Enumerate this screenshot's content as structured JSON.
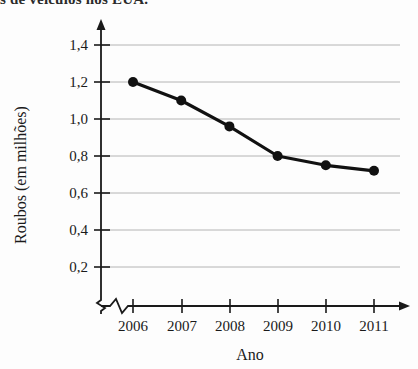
{
  "caption_fragment": "s de veículos nos EUA.",
  "chart_data": {
    "type": "line",
    "title": "",
    "xlabel": "Ano",
    "ylabel": "Roubos (em milhões)",
    "categories": [
      "2006",
      "2007",
      "2008",
      "2009",
      "2010",
      "2011"
    ],
    "values": [
      1.2,
      1.1,
      0.96,
      0.8,
      0.75,
      0.72
    ],
    "value_labels": [
      "1,20",
      "1,10",
      "0,96",
      "0,80",
      "0,75",
      "0,72"
    ],
    "ytick_labels": [
      "0,2",
      "0,4",
      "0,6",
      "0,8",
      "1,0",
      "1,2",
      "1,4"
    ],
    "ytick_values": [
      0.2,
      0.4,
      0.6,
      0.8,
      1.0,
      1.2,
      1.4
    ],
    "ylim": [
      0.2,
      1.4
    ],
    "grid": true,
    "legend": "none",
    "marker": "filled-circle",
    "line_color": "#111111",
    "grid_color": "#b4b4b4",
    "axis_color": "#1a1a1a",
    "background_color": "#fdfdfd",
    "y_axis_break": true,
    "x_axis_break": true,
    "axis_arrows": true
  },
  "axes": {
    "y_title": "Roubos (em milhões)",
    "x_title": "Ano"
  }
}
